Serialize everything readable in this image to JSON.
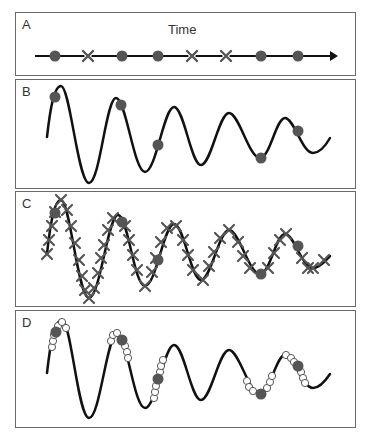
{
  "panels": [
    {
      "id": "A",
      "label": "A",
      "title": "Time",
      "top": 12,
      "height": 64
    },
    {
      "id": "B",
      "label": "B",
      "top": 79,
      "height": 110
    },
    {
      "id": "C",
      "label": "C",
      "top": 191,
      "height": 116
    },
    {
      "id": "D",
      "label": "D",
      "top": 310,
      "height": 118
    }
  ],
  "timeline": {
    "markers": [
      "dot",
      "x",
      "dot",
      "dot",
      "x",
      "x",
      "dot",
      "dot"
    ],
    "marker_x": [
      55,
      88,
      122,
      158,
      192,
      226,
      261,
      298
    ]
  },
  "colors": {
    "curve": "#111111",
    "sample_dot": "#555555",
    "x_marker": "#555555",
    "open_circle_fill": "#ffffff",
    "open_circle_stroke": "#555555",
    "border": "#6a6a6a"
  }
}
